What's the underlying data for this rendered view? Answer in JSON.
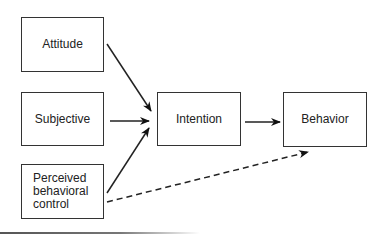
{
  "diagram": {
    "nodes": [
      {
        "id": "attitude",
        "label": "Attitude"
      },
      {
        "id": "subjective",
        "label": "Subjective"
      },
      {
        "id": "pbc",
        "label": "Perceived\nbehavioral\ncontrol"
      },
      {
        "id": "intention",
        "label": "Intention"
      },
      {
        "id": "behavior",
        "label": "Behavior"
      }
    ],
    "edges": [
      {
        "from": "attitude",
        "to": "intention",
        "style": "solid"
      },
      {
        "from": "subjective",
        "to": "intention",
        "style": "solid"
      },
      {
        "from": "pbc",
        "to": "intention",
        "style": "solid"
      },
      {
        "from": "intention",
        "to": "behavior",
        "style": "solid"
      },
      {
        "from": "pbc",
        "to": "behavior",
        "style": "dashed"
      }
    ],
    "colors": {
      "stroke": "#222222",
      "background": "#ffffff"
    }
  }
}
